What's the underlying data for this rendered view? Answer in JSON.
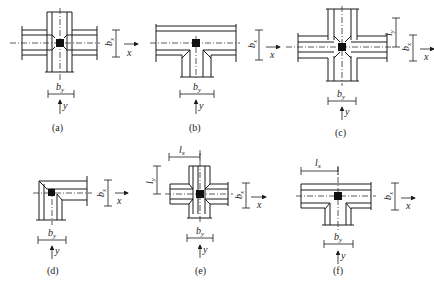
{
  "diagram": {
    "type": "beam-column joint plan configurations",
    "panels": [
      {
        "id": "a",
        "caption": "(a)",
        "joint": "interior cross (four beams)",
        "labels": {
          "bx": "b",
          "bx_sub": "x",
          "by": "b",
          "by_sub": "y",
          "x_axis": "x",
          "y_axis": "y"
        }
      },
      {
        "id": "b",
        "caption": "(b)",
        "joint": "exterior T (beam continuous in x, one beam in y)",
        "labels": {
          "bx": "b",
          "bx_sub": "x",
          "by": "b",
          "by_sub": "y",
          "x_axis": "x",
          "y_axis": "y"
        }
      },
      {
        "id": "c",
        "caption": "(c)",
        "joint": "interior cross with beam stub length l_y",
        "labels": {
          "bx": "b",
          "bx_sub": "x",
          "by": "b",
          "by_sub": "y",
          "ly": "l",
          "ly_sub": "y",
          "x_axis": "x",
          "y_axis": "y"
        }
      },
      {
        "id": "d",
        "caption": "(d)",
        "joint": "corner L",
        "labels": {
          "bx": "b",
          "bx_sub": "x",
          "by": "b",
          "by_sub": "y",
          "x_axis": "x",
          "y_axis": "y"
        }
      },
      {
        "id": "e",
        "caption": "(e)",
        "joint": "interior cross with stub lengths l_x, l_y",
        "labels": {
          "bx": "b",
          "bx_sub": "x",
          "by": "b",
          "by_sub": "y",
          "lx": "l",
          "lx_sub": "x",
          "ly": "l",
          "ly_sub": "y",
          "x_axis": "x",
          "y_axis": "y"
        }
      },
      {
        "id": "f",
        "caption": "(f)",
        "joint": "exterior T with stub length l_x",
        "labels": {
          "bx": "b",
          "bx_sub": "x",
          "by": "b",
          "by_sub": "y",
          "lx": "l",
          "lx_sub": "x",
          "x_axis": "x",
          "y_axis": "y"
        }
      }
    ]
  }
}
